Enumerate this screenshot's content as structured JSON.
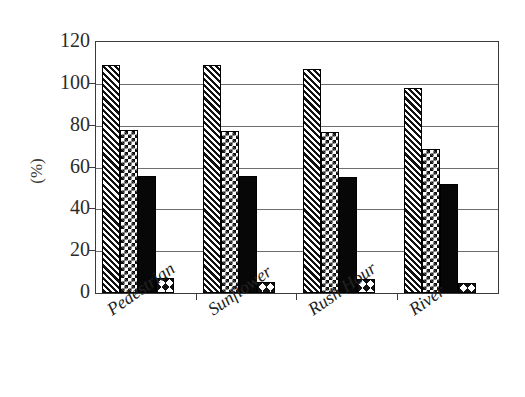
{
  "chart_data": {
    "type": "bar",
    "title": "",
    "xlabel": "",
    "ylabel": "(%)",
    "categories": [
      "Pedestrian",
      "Sunflower",
      "Rush Hour",
      "River"
    ],
    "series": [
      {
        "name": "series-1",
        "pattern": "diagonal-hatch",
        "values": [
          109,
          109,
          107,
          98
        ]
      },
      {
        "name": "series-2",
        "pattern": "checkerboard",
        "values": [
          78,
          77.5,
          77,
          69
        ]
      },
      {
        "name": "series-3",
        "pattern": "solid-black",
        "values": [
          56,
          56,
          55.5,
          52
        ]
      },
      {
        "name": "series-4",
        "pattern": "zigzag",
        "values": [
          7,
          5.5,
          6.5,
          5
        ]
      }
    ],
    "ylim": [
      0,
      120
    ],
    "yticks": [
      0,
      20,
      40,
      60,
      80,
      100,
      120
    ],
    "ytick_labels": [
      "0",
      "20",
      "40",
      "60",
      "80",
      "100",
      "120"
    ],
    "grid": "horizontal",
    "legend": "none",
    "colors": {
      "axis": "#3a3a3a",
      "gridline": "#6e6e6e",
      "bar_outline": "#000000",
      "bar_fill": "#111111",
      "background": "#ffffff",
      "text": "#222222"
    }
  }
}
